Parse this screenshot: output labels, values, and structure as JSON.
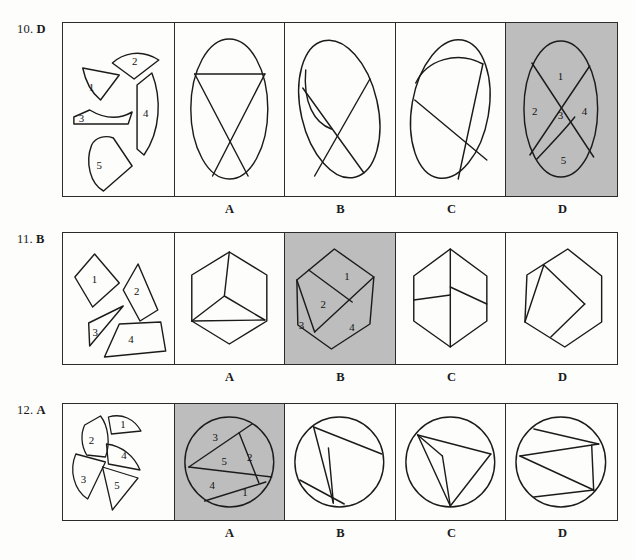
{
  "page": {
    "kind": "spatial-reasoning-worksheet",
    "ink_color": "#1b1b1b",
    "shade_color": "#bdbdbd",
    "background": "#fdfdfb"
  },
  "questions": [
    {
      "number": "10.",
      "answer": "D",
      "label": "10. D",
      "pieces_labels": [
        "1",
        "2",
        "3",
        "4",
        "5"
      ],
      "options": [
        {
          "letter": "A",
          "shaded": false
        },
        {
          "letter": "B",
          "shaded": false
        },
        {
          "letter": "C",
          "shaded": false
        },
        {
          "letter": "D",
          "shaded": true,
          "region_labels": [
            "1",
            "2",
            "3",
            "4",
            "5"
          ]
        }
      ]
    },
    {
      "number": "11.",
      "answer": "B",
      "label": "11. B",
      "pieces_labels": [
        "1",
        "2",
        "3",
        "4"
      ],
      "options": [
        {
          "letter": "A",
          "shaded": false
        },
        {
          "letter": "B",
          "shaded": true,
          "region_labels": [
            "1",
            "2",
            "3",
            "4"
          ]
        },
        {
          "letter": "C",
          "shaded": false
        },
        {
          "letter": "D",
          "shaded": false
        }
      ]
    },
    {
      "number": "12.",
      "answer": "A",
      "label": "12. A",
      "pieces_labels": [
        "1",
        "2",
        "3",
        "4",
        "5"
      ],
      "options": [
        {
          "letter": "A",
          "shaded": true,
          "region_labels": [
            "1",
            "2",
            "3",
            "4",
            "5"
          ]
        },
        {
          "letter": "B",
          "shaded": false
        },
        {
          "letter": "C",
          "shaded": false
        },
        {
          "letter": "D",
          "shaded": false
        }
      ]
    }
  ]
}
